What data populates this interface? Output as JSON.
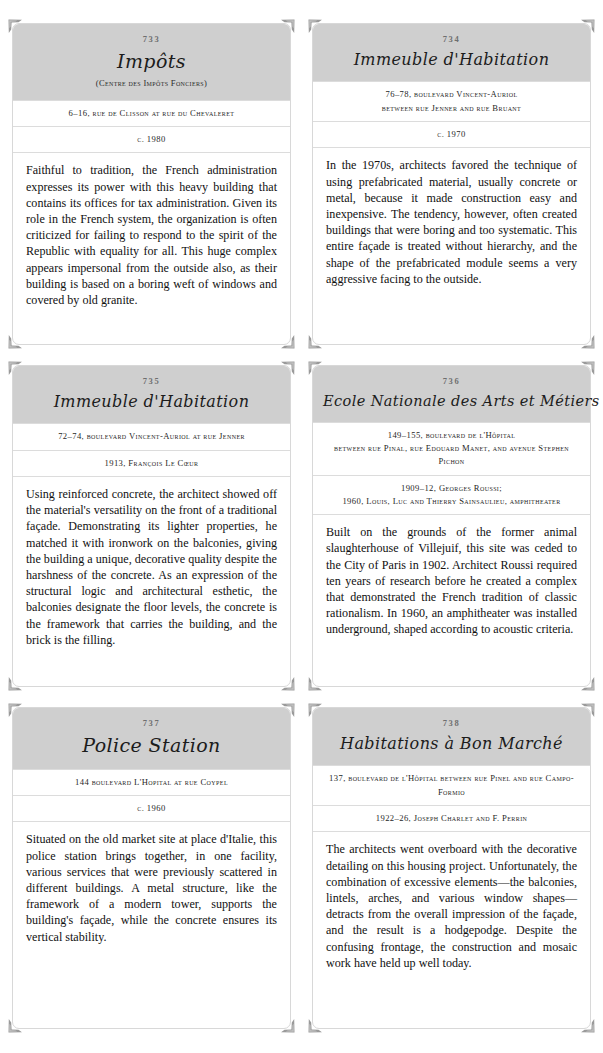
{
  "page": {
    "background_color": "#ffffff",
    "header_color": "#cfcfcf",
    "border_color": "#d8d8d8"
  },
  "cards": [
    {
      "number": "733",
      "title": "Impôts",
      "subtitle": "(Centre des Impôts Fonciers)",
      "address_lines": [
        "6–16, rue de Clisson at rue du Chevaleret"
      ],
      "date_lines": [
        "c. 1980"
      ],
      "body": "Faithful to tradition, the French administration expresses its power with this heavy building that contains its offices for tax administration. Given its role in the French system, the organization is often criticized for failing to respond to the spirit of the Republic with equality for all. This huge complex appears impersonal from the outside also, as their building is based on a boring weft of windows and covered by old granite."
    },
    {
      "number": "734",
      "title": "Immeuble d'Habitation",
      "subtitle": "",
      "address_lines": [
        "76–78, boulevard Vincent-Auriol",
        "between rue Jenner and rue Bruant"
      ],
      "date_lines": [
        "c. 1970"
      ],
      "body": "In the 1970s, architects favored the technique of using prefabricated material, usually concrete or metal, because it made construction easy and inexpensive. The tendency, however, often created buildings that were boring and too systematic. This entire façade is treated without hierarchy, and the shape of the prefabricated module seems a very aggressive facing to the outside."
    },
    {
      "number": "735",
      "title": "Immeuble d'Habitation",
      "subtitle": "",
      "address_lines": [
        "72–74, boulevard Vincent-Auriol at rue Jenner"
      ],
      "date_lines": [
        "1913, François Le Cœur"
      ],
      "body": "Using reinforced concrete, the architect showed off the material's versatility on the front of a traditional façade. Demonstrating its lighter properties, he matched it with ironwork on the balconies, giving the building a unique, decorative quality despite the harshness of the concrete. As an expression of the structural logic and architectural esthetic, the balconies designate the floor levels, the concrete is the framework that carries the building, and the brick is the filling."
    },
    {
      "number": "736",
      "title": "Ecole Nationale des Arts et Métiers",
      "subtitle": "",
      "address_lines": [
        "149–155, boulevard de l'Hôpital",
        "between rue Pinal, rue Edouard Manet, and avenue Stephen Pichon"
      ],
      "date_lines": [
        "1909–12, Georges Roussi;",
        "1960, Louis, Luc and Thierry Sainsaulieu, amphitheater"
      ],
      "body": "Built on the grounds of the former animal slaughterhouse of Villejuif, this site was ceded to the City of Paris in 1902. Architect Roussi required ten years of research before he created a complex that demonstrated the French tradition of classic rationalism. In 1960, an amphitheater was installed underground, shaped according to acoustic criteria."
    },
    {
      "number": "737",
      "title": "Police Station",
      "subtitle": "",
      "address_lines": [
        "144 boulevard L'Hopital at rue Coypel"
      ],
      "date_lines": [
        "c. 1960"
      ],
      "body": "Situated on the old market site at place d'Italie, this police station brings together, in one facility, various services that were previously scattered in different buildings. A metal structure, like the framework of a modern tower, supports the building's façade, while the concrete ensures its vertical stability."
    },
    {
      "number": "738",
      "title": "Habitations à Bon Marché",
      "subtitle": "",
      "address_lines": [
        "137, boulevard de l'Hôpital between rue Pinel and rue Campo-Formio"
      ],
      "date_lines": [
        "1922–26, Joseph Charlet and F. Perrin"
      ],
      "body": "The architects went overboard with the decorative detailing on this housing project. Unfortunately, the combination of excessive elements—the balconies, lintels, arches, and various window shapes—detracts from the overall impression of the façade, and the result is a hodgepodge. Despite the confusing frontage, the construction and mosaic work have held up well today."
    }
  ]
}
